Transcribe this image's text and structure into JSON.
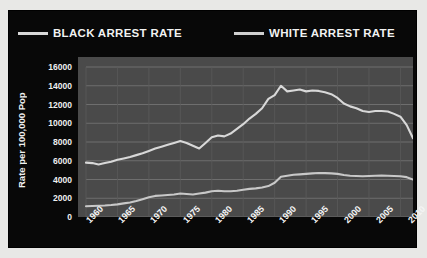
{
  "legend": {
    "items": [
      {
        "label": "BLACK ARREST RATE",
        "color": "#d8d8d8",
        "swatch": "black-series-swatch"
      },
      {
        "label": "WHITE ARREST RATE",
        "color": "#cfcfcf",
        "swatch": "white-series-swatch"
      }
    ]
  },
  "axis": {
    "y_title": "Rate per 100,000 Pop",
    "y_ticks": [
      "16000",
      "14000",
      "12000",
      "10000",
      "8000",
      "6000",
      "4000",
      "2000",
      "0"
    ],
    "x_ticks": [
      "1960",
      "1965",
      "1970",
      "1975",
      "1980",
      "1985",
      "1990",
      "1995",
      "2000",
      "2005",
      "2010"
    ]
  },
  "colors": {
    "panel_background": "#080808",
    "plot_background": "#4a4a4a",
    "gridline": "#6e6e6e",
    "series_black": "#d8d8d8",
    "series_white": "#c8c8c8",
    "text": "#f2f2f2",
    "page_background": "#e8e8e6"
  },
  "chart_data": {
    "type": "line",
    "title": "",
    "xlabel": "",
    "ylabel": "Rate per 100,000 Pop",
    "xlim": [
      1960,
      2012
    ],
    "ylim": [
      0,
      16000
    ],
    "grid": true,
    "legend_position": "top",
    "x": [
      1960,
      1961,
      1962,
      1963,
      1964,
      1965,
      1966,
      1967,
      1968,
      1969,
      1970,
      1971,
      1972,
      1973,
      1974,
      1975,
      1976,
      1977,
      1978,
      1979,
      1980,
      1981,
      1982,
      1983,
      1984,
      1985,
      1986,
      1987,
      1988,
      1989,
      1990,
      1991,
      1992,
      1993,
      1994,
      1995,
      1996,
      1997,
      1998,
      1999,
      2000,
      2001,
      2002,
      2003,
      2004,
      2005,
      2006,
      2007,
      2008,
      2009,
      2010,
      2011,
      2012
    ],
    "series": [
      {
        "name": "BLACK ARREST RATE",
        "color": "#d8d8d8",
        "values": [
          5800,
          5750,
          5600,
          5750,
          5900,
          6100,
          6250,
          6400,
          6600,
          6800,
          7050,
          7300,
          7500,
          7700,
          7900,
          8100,
          7900,
          7600,
          7300,
          7900,
          8500,
          8700,
          8600,
          8900,
          9400,
          9900,
          10500,
          11000,
          11600,
          12600,
          13000,
          14000,
          13400,
          13500,
          13600,
          13400,
          13500,
          13450,
          13300,
          13100,
          12700,
          12100,
          11800,
          11600,
          11300,
          11200,
          11300,
          11300,
          11250,
          11000,
          10700,
          9800,
          8400
        ]
      },
      {
        "name": "WHITE ARREST RATE",
        "color": "#c8c8c8",
        "values": [
          1150,
          1180,
          1200,
          1230,
          1280,
          1350,
          1450,
          1550,
          1700,
          1900,
          2100,
          2250,
          2300,
          2350,
          2400,
          2500,
          2450,
          2400,
          2500,
          2600,
          2750,
          2800,
          2750,
          2750,
          2800,
          2900,
          3000,
          3050,
          3150,
          3300,
          3650,
          4300,
          4400,
          4500,
          4550,
          4600,
          4650,
          4700,
          4680,
          4650,
          4600,
          4480,
          4400,
          4380,
          4350,
          4380,
          4400,
          4420,
          4400,
          4380,
          4350,
          4250,
          4000
        ]
      }
    ]
  }
}
